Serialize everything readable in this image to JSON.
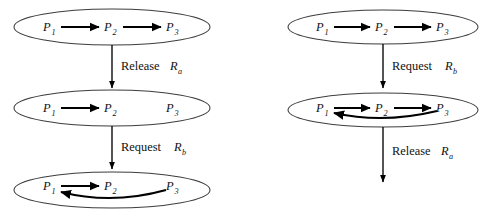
{
  "figure": {
    "title": "",
    "background_color": "#ffffff",
    "stroke_color": "#000000",
    "ellipse_stroke_color": "#3d3d3d",
    "width": 490,
    "height": 217
  },
  "columns": [
    {
      "name": "left-sequence",
      "states": [
        {
          "name": "state-left-1",
          "nodes": [
            {
              "label": "P",
              "subscript": "1"
            },
            {
              "label": "P",
              "subscript": "2"
            },
            {
              "label": "P",
              "subscript": "3"
            }
          ],
          "edges": [
            {
              "from": "P1",
              "to": "P2",
              "shape": "straight"
            },
            {
              "from": "P2",
              "to": "P3",
              "shape": "straight"
            }
          ]
        },
        {
          "name": "state-left-2",
          "nodes": [
            {
              "label": "P",
              "subscript": "1"
            },
            {
              "label": "P",
              "subscript": "2"
            },
            {
              "label": "P",
              "subscript": "3"
            }
          ],
          "edges": [
            {
              "from": "P1",
              "to": "P2",
              "shape": "straight"
            }
          ]
        },
        {
          "name": "state-left-3",
          "nodes": [
            {
              "label": "P",
              "subscript": "1"
            },
            {
              "label": "P",
              "subscript": "2"
            },
            {
              "label": "P",
              "subscript": "3"
            }
          ],
          "edges": [
            {
              "from": "P1",
              "to": "P2",
              "shape": "straight"
            },
            {
              "from": "P3",
              "to": "P1",
              "shape": "curved"
            }
          ]
        }
      ],
      "transitions": [
        {
          "name": "transition-left-1",
          "action": "Release",
          "resource": "R",
          "resource_subscript": "a"
        },
        {
          "name": "transition-left-2",
          "action": "Request",
          "resource": "R",
          "resource_subscript": "b"
        }
      ]
    },
    {
      "name": "right-sequence",
      "states": [
        {
          "name": "state-right-1",
          "nodes": [
            {
              "label": "P",
              "subscript": "1"
            },
            {
              "label": "P",
              "subscript": "2"
            },
            {
              "label": "P",
              "subscript": "3"
            }
          ],
          "edges": [
            {
              "from": "P1",
              "to": "P2",
              "shape": "straight"
            },
            {
              "from": "P2",
              "to": "P3",
              "shape": "straight"
            }
          ]
        },
        {
          "name": "state-right-2",
          "nodes": [
            {
              "label": "P",
              "subscript": "1"
            },
            {
              "label": "P",
              "subscript": "2"
            },
            {
              "label": "P",
              "subscript": "3"
            }
          ],
          "edges": [
            {
              "from": "P1",
              "to": "P2",
              "shape": "straight"
            },
            {
              "from": "P2",
              "to": "P3",
              "shape": "straight"
            },
            {
              "from": "P3",
              "to": "P1",
              "shape": "curved"
            }
          ]
        }
      ],
      "transitions": [
        {
          "name": "transition-right-1",
          "action": "Request",
          "resource": "R",
          "resource_subscript": "b"
        },
        {
          "name": "transition-right-2",
          "action": "Release",
          "resource": "R",
          "resource_subscript": "a"
        }
      ]
    }
  ],
  "labels": {
    "left_t1_action": "Release",
    "left_t1_res": "R",
    "left_t1_sub": "a",
    "left_t2_action": "Request",
    "left_t2_res": "R",
    "left_t2_sub": "b",
    "right_t1_action": "Request",
    "right_t1_res": "R",
    "right_t1_sub": "b",
    "right_t2_action": "Release",
    "right_t2_res": "R",
    "right_t2_sub": "a",
    "p": "P",
    "s1": "1",
    "s2": "2",
    "s3": "3"
  }
}
